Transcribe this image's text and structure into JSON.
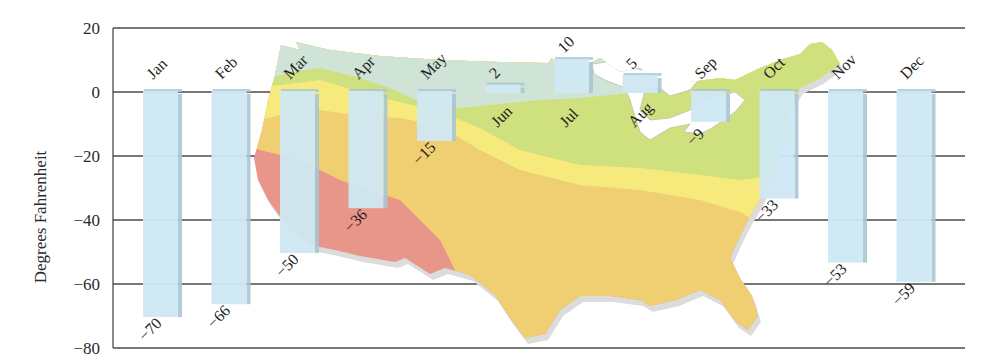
{
  "chart_data": {
    "type": "bar",
    "title": "",
    "xlabel": "",
    "ylabel": "Degrees Fahrenheit",
    "ylim": [
      -80,
      20
    ],
    "yticks": [
      20,
      0,
      -20,
      -40,
      -60,
      -80
    ],
    "grid": true,
    "legend": null,
    "background": "Map of the contiguous United States shaded by temperature zones",
    "categories": [
      "Jan",
      "Feb",
      "Mar",
      "Apr",
      "May",
      "Jun",
      "Jul",
      "Aug",
      "Sep",
      "Oct",
      "Nov",
      "Dec"
    ],
    "values": [
      -70,
      -66,
      -50,
      -36,
      -15,
      2,
      10,
      5,
      -9,
      -33,
      -53,
      -59
    ],
    "value_labels": [
      "−70",
      "−66",
      "−50",
      "−36",
      "−15",
      "2",
      "10",
      "5",
      "−9",
      "−33",
      "−53",
      "−59"
    ],
    "bar_color": "#cfe8f3",
    "bar_edge_color": "#a9c6d3"
  },
  "axis": {
    "ylabel": "Degrees Fahrenheit",
    "tick_labels": [
      "20",
      "0",
      "−20",
      "−40",
      "−60",
      "−80"
    ]
  },
  "map_colors": {
    "zone_north": "#cfe3d6",
    "zone_green": "#cfe07e",
    "zone_yellow": "#f6ea7c",
    "zone_orange": "#f0cf72",
    "zone_red": "#e8968a",
    "lakes": "#ffffff",
    "shadow": "#d9d9d9"
  }
}
